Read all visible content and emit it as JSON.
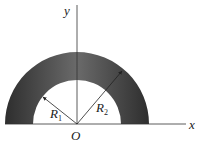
{
  "diagram": {
    "axes": {
      "x_label": "x",
      "y_label": "y",
      "origin_label": "O"
    },
    "radii": [
      {
        "symbol": "R",
        "subscript": "1",
        "description": "inner radius"
      },
      {
        "symbol": "R",
        "subscript": "2",
        "description": "outer radius"
      }
    ],
    "colors": {
      "ring_dark": "#2e2e2e",
      "ring_light": "#6a6a6a",
      "axis": "#333333"
    }
  }
}
